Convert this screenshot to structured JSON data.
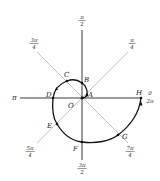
{
  "diagram": {
    "origin_label": "O",
    "colors": {
      "axis": "#222222",
      "diagonal": "#b5b5b5",
      "curve": "#111111",
      "point": "#111111"
    },
    "angle_labels": {
      "right_top": "0",
      "right_bottom": "2π",
      "left": "π",
      "top": {
        "num": "π",
        "den": "2"
      },
      "bottom": {
        "num": "3π",
        "den": "2"
      },
      "ne": {
        "num": "π",
        "den": "4"
      },
      "nw": {
        "num": "3π",
        "den": "4"
      },
      "sw": {
        "num": "5π",
        "den": "4"
      },
      "se": {
        "num": "7π",
        "den": "4"
      }
    },
    "points": [
      {
        "label": "A",
        "angle": "π/4"
      },
      {
        "label": "B",
        "angle": "π/2"
      },
      {
        "label": "C",
        "angle": "3π/4"
      },
      {
        "label": "D",
        "angle": "π"
      },
      {
        "label": "E",
        "angle": "5π/4"
      },
      {
        "label": "F",
        "angle": "3π/2"
      },
      {
        "label": "G",
        "angle": "7π/4"
      },
      {
        "label": "H",
        "angle": "2π"
      }
    ]
  }
}
